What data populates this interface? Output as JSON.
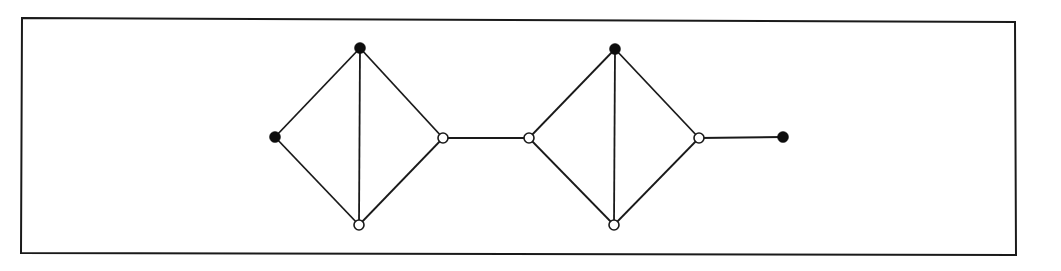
{
  "diagram": {
    "type": "graph",
    "colors": {
      "stroke": "#1a1a1a",
      "filled_node": "#0d0d0d",
      "open_node_fill": "#ffffff",
      "background": "#ffffff"
    },
    "frame": {
      "points": [
        [
          22,
          18
        ],
        [
          1015,
          22
        ],
        [
          1016,
          255
        ],
        [
          21,
          253
        ]
      ]
    },
    "nodes": [
      {
        "id": "a",
        "x": 275,
        "y": 137,
        "filled": true
      },
      {
        "id": "b",
        "x": 360,
        "y": 48,
        "filled": true
      },
      {
        "id": "c",
        "x": 359,
        "y": 225,
        "filled": false
      },
      {
        "id": "d",
        "x": 443,
        "y": 138,
        "filled": false
      },
      {
        "id": "e",
        "x": 529,
        "y": 138,
        "filled": false
      },
      {
        "id": "f",
        "x": 615,
        "y": 49,
        "filled": true
      },
      {
        "id": "g",
        "x": 614,
        "y": 225,
        "filled": false
      },
      {
        "id": "h",
        "x": 699,
        "y": 138,
        "filled": false
      },
      {
        "id": "i",
        "x": 783,
        "y": 137,
        "filled": true
      }
    ],
    "edges": [
      [
        "a",
        "b"
      ],
      [
        "a",
        "c"
      ],
      [
        "b",
        "c"
      ],
      [
        "b",
        "d"
      ],
      [
        "c",
        "d"
      ],
      [
        "d",
        "e"
      ],
      [
        "e",
        "f"
      ],
      [
        "e",
        "g"
      ],
      [
        "f",
        "g"
      ],
      [
        "f",
        "h"
      ],
      [
        "g",
        "h"
      ],
      [
        "h",
        "i"
      ]
    ],
    "node_radius": 5
  }
}
